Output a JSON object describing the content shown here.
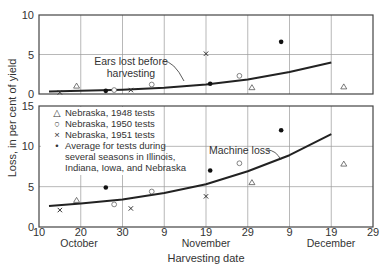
{
  "chart_data": [
    {
      "panel": "top",
      "type": "scatter",
      "title": "",
      "annotation": "Ears lost before harvesting",
      "ylabel": "Loss, in per cent of yield",
      "xlabel": "Harvesting date",
      "ylim": [
        0,
        10
      ],
      "yticks": [
        0,
        5,
        10
      ],
      "grid": true,
      "x_unit": "days after October 10",
      "curve": {
        "name": "Ears lost before harvesting",
        "x": [
          2.4,
          10,
          20,
          30,
          40,
          50,
          60,
          70
        ],
        "y": [
          0.3,
          0.4,
          0.55,
          0.8,
          1.2,
          1.85,
          2.8,
          4.0
        ]
      },
      "series": [
        {
          "name": "Nebraska, 1948 tests",
          "marker": "triangle",
          "x": [
            9,
            51,
            73
          ],
          "y": [
            1.0,
            0.8,
            0.9
          ]
        },
        {
          "name": "Nebraska, 1950 tests",
          "marker": "circle-open",
          "x": [
            18,
            27,
            48
          ],
          "y": [
            0.5,
            1.2,
            2.3
          ]
        },
        {
          "name": "Nebraska, 1951 tests",
          "marker": "x",
          "x": [
            5,
            22,
            40
          ],
          "y": [
            0.2,
            0.5,
            5.1
          ]
        },
        {
          "name": "Average for tests during several seasons in Illinois, Indiana, Iowa, and Nebraska",
          "marker": "dot",
          "x": [
            16,
            41,
            58
          ],
          "y": [
            0.4,
            1.3,
            6.6
          ]
        }
      ]
    },
    {
      "panel": "bottom",
      "type": "scatter",
      "title": "",
      "annotation": "Machine loss",
      "ylabel": "Loss, in per cent of yield",
      "xlabel": "Harvesting date",
      "ylim": [
        0,
        15
      ],
      "yticks": [
        0,
        5,
        10,
        15
      ],
      "grid": true,
      "legend_position": "upper left",
      "x_unit": "days after October 10",
      "curve": {
        "name": "Machine loss",
        "x": [
          2.4,
          10,
          20,
          30,
          40,
          50,
          60,
          70
        ],
        "y": [
          2.6,
          2.9,
          3.4,
          4.2,
          5.3,
          6.9,
          8.9,
          11.5
        ]
      },
      "series": [
        {
          "name": "Nebraska, 1948 tests",
          "marker": "triangle",
          "x": [
            9,
            51,
            73
          ],
          "y": [
            3.3,
            5.5,
            7.8
          ]
        },
        {
          "name": "Nebraska, 1950 tests",
          "marker": "circle-open",
          "x": [
            18,
            27,
            48
          ],
          "y": [
            2.8,
            4.4,
            7.9
          ]
        },
        {
          "name": "Nebraska, 1951 tests",
          "marker": "x",
          "x": [
            5,
            22,
            40
          ],
          "y": [
            2.1,
            2.3,
            3.8
          ]
        },
        {
          "name": "Average for tests during several seasons in Illinois, Indiana, Iowa, and Nebraska",
          "marker": "dot",
          "x": [
            16,
            41,
            58
          ],
          "y": [
            4.9,
            7.0,
            12.0
          ]
        }
      ]
    }
  ],
  "axes": {
    "ylabel": "Loss, in per cent of yield",
    "xlabel": "Harvesting date",
    "xtick_labels": [
      "10",
      "20",
      "30",
      "9",
      "19",
      "29",
      "9",
      "19",
      "29"
    ],
    "month_labels": [
      "October",
      "November",
      "December"
    ],
    "top_yticks": [
      "0",
      "5",
      "10"
    ],
    "bottom_yticks": [
      "0",
      "5",
      "10",
      "15"
    ]
  },
  "annotations": {
    "top_line1": "Ears lost before",
    "top_line2": "harvesting",
    "bottom": "Machine loss"
  },
  "legend": [
    {
      "symbol": "△",
      "label": "Nebraska, 1948 tests"
    },
    {
      "symbol": "○",
      "label": "Nebraska, 1950 tests"
    },
    {
      "symbol": "×",
      "label": "Nebraska, 1951 tests"
    },
    {
      "symbol": "•",
      "label": "Average for tests during",
      "line2": "several seasons in Illinois,",
      "line3": "Indiana, Iowa, and Nebraska"
    }
  ]
}
